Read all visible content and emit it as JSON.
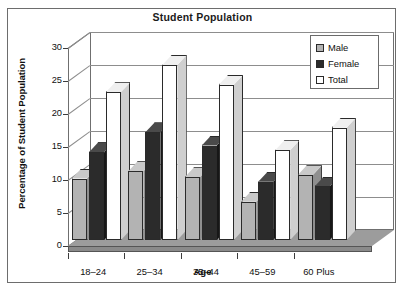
{
  "chart_data": {
    "type": "bar",
    "title": "Student Population",
    "xlabel": "Age",
    "ylabel": "Percentage of Student Population",
    "categories": [
      "18–24",
      "25–34",
      "35–44",
      "45–59",
      "60 Plus"
    ],
    "series": [
      {
        "name": "Male",
        "color": "#b3b3b3",
        "values": [
          9.3,
          10.4,
          9.5,
          5.8,
          9.8
        ]
      },
      {
        "name": "Female",
        "color": "#2b2b2b",
        "values": [
          13.3,
          16.3,
          14.3,
          8.8,
          8.1
        ]
      },
      {
        "name": "Total",
        "color": "#ffffff",
        "values": [
          22.4,
          26.5,
          23.5,
          13.6,
          17.0
        ]
      }
    ],
    "ylim": [
      0,
      30
    ],
    "yticks": [
      0,
      5,
      10,
      15,
      20,
      25,
      30
    ],
    "ytick_labels": [
      "0",
      "5",
      "10",
      "15",
      "20",
      "25",
      "30"
    ],
    "grid": true,
    "legend_position": "top-right",
    "style": "3d-column"
  },
  "legend": {
    "entries": [
      {
        "label": "Male",
        "swatch": "#b3b3b3"
      },
      {
        "label": "Female",
        "swatch": "#2b2b2b"
      },
      {
        "label": "Total",
        "swatch": "#ffffff"
      }
    ]
  }
}
